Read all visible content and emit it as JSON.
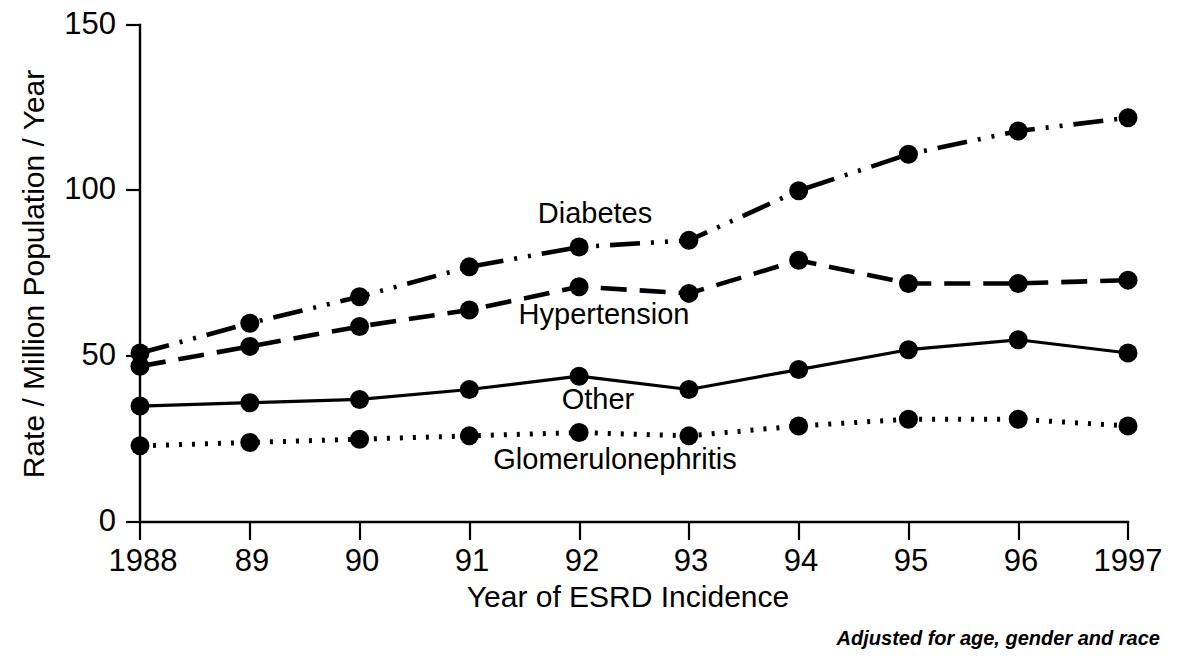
{
  "chart_data": {
    "type": "line",
    "title": "",
    "xlabel": "Year of ESRD Incidence",
    "ylabel": "Rate / Million Population / Year",
    "x": [
      1988,
      1989,
      1990,
      1991,
      1992,
      1993,
      1994,
      1995,
      1996,
      1997
    ],
    "categories": [
      "1988",
      "89",
      "90",
      "91",
      "92",
      "93",
      "94",
      "95",
      "96",
      "1997"
    ],
    "xlim": [
      1988,
      1997
    ],
    "ylim": [
      0,
      150
    ],
    "yticks": [
      0,
      50,
      100,
      150
    ],
    "ytick_labels": [
      "0",
      "50",
      "100",
      "150"
    ],
    "grid": false,
    "legend_position": "inline-annotations",
    "annotation": "Adjusted for age, gender and race",
    "series": [
      {
        "name": "Diabetes",
        "linestyle": "dash-dot-dot",
        "marker": "filled-circle",
        "values": [
          51,
          60,
          68,
          77,
          83,
          85,
          100,
          111,
          118,
          122
        ]
      },
      {
        "name": "Hypertension",
        "linestyle": "dashed",
        "marker": "filled-circle",
        "values": [
          47,
          53,
          59,
          64,
          71,
          69,
          79,
          72,
          72,
          73
        ]
      },
      {
        "name": "Other",
        "linestyle": "solid",
        "marker": "filled-circle",
        "values": [
          35,
          36,
          37,
          40,
          44,
          40,
          46,
          52,
          55,
          51
        ]
      },
      {
        "name": "Glomerulonephritis",
        "linestyle": "dotted",
        "marker": "filled-circle",
        "values": [
          23,
          24,
          25,
          26,
          27,
          26,
          29,
          31,
          31,
          29
        ]
      }
    ],
    "series_labels": [
      {
        "name": "Diabetes",
        "text": "Diabetes",
        "x": 595,
        "y": 223
      },
      {
        "name": "Hypertension",
        "text": "Hypertension",
        "x": 604,
        "y": 324
      },
      {
        "name": "Other",
        "text": "Other",
        "x": 598,
        "y": 409
      },
      {
        "name": "Glomerulonephritis",
        "text": "Glomerulonephritis",
        "x": 615,
        "y": 469
      }
    ]
  },
  "colors": {
    "ink": "#000000",
    "background": "#ffffff"
  }
}
